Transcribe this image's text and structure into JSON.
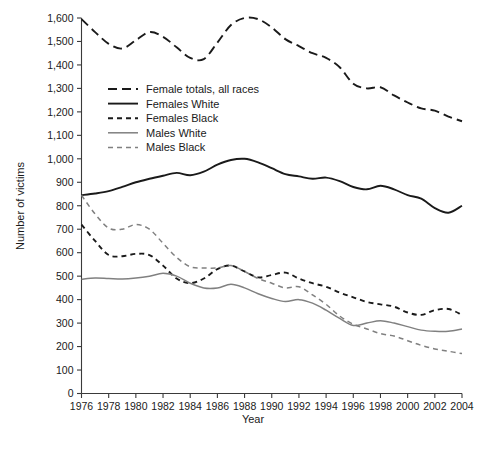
{
  "chart_data": {
    "type": "line",
    "title": "",
    "xlabel": "Year",
    "ylabel": "Number of victims",
    "xlim": [
      1976,
      2004
    ],
    "ylim": [
      0,
      1600
    ],
    "grid": false,
    "legend_position": "upper-left-inside",
    "x": [
      1976,
      1977,
      1978,
      1979,
      1980,
      1981,
      1982,
      1983,
      1984,
      1985,
      1986,
      1987,
      1988,
      1989,
      1990,
      1991,
      1992,
      1993,
      1994,
      1995,
      1996,
      1997,
      1998,
      1999,
      2000,
      2001,
      2002,
      2003,
      2004
    ],
    "x_ticks": [
      1976,
      1978,
      1980,
      1982,
      1984,
      1986,
      1988,
      1990,
      1992,
      1994,
      1996,
      1998,
      2000,
      2002,
      2004
    ],
    "x_tick_labels": [
      "1976",
      "1978",
      "1980",
      "1982",
      "1984",
      "1986",
      "1988",
      "1990",
      "1992",
      "1994",
      "1996",
      "1998",
      "2000",
      "2002",
      "2004"
    ],
    "y_ticks": [
      0,
      100,
      200,
      300,
      400,
      500,
      600,
      700,
      800,
      900,
      1000,
      1100,
      1200,
      1300,
      1400,
      1500,
      1600
    ],
    "y_tick_labels": [
      "0",
      "100",
      "200",
      "300",
      "400",
      "500",
      "600",
      "700",
      "800",
      "900",
      "1,000",
      "1,100",
      "1,200",
      "1,300",
      "1,400",
      "1,500",
      "1,600"
    ],
    "series": [
      {
        "name": "Female totals, all races",
        "color": "#1a1a1a",
        "width": 1.9,
        "dash": "9,5",
        "values": [
          1595,
          1540,
          1490,
          1470,
          1505,
          1540,
          1520,
          1475,
          1430,
          1425,
          1495,
          1570,
          1600,
          1595,
          1560,
          1510,
          1480,
          1450,
          1430,
          1390,
          1320,
          1300,
          1305,
          1270,
          1240,
          1215,
          1205,
          1180,
          1160
        ]
      },
      {
        "name": "Females White",
        "color": "#1a1a1a",
        "width": 1.9,
        "dash": "none",
        "values": [
          845,
          852,
          862,
          880,
          900,
          915,
          928,
          940,
          930,
          945,
          975,
          995,
          1000,
          985,
          960,
          935,
          925,
          915,
          920,
          905,
          880,
          870,
          885,
          870,
          845,
          830,
          790,
          770,
          800
        ]
      },
      {
        "name": "Females Black",
        "color": "#1a1a1a",
        "width": 1.9,
        "dash": "5,4",
        "values": [
          720,
          650,
          590,
          585,
          595,
          590,
          545,
          490,
          470,
          490,
          530,
          545,
          520,
          495,
          505,
          515,
          490,
          470,
          455,
          430,
          410,
          390,
          380,
          370,
          345,
          335,
          355,
          360,
          335
        ]
      },
      {
        "name": "Males White",
        "color": "#808080",
        "width": 1.5,
        "dash": "none",
        "values": [
          487,
          492,
          490,
          488,
          492,
          500,
          512,
          500,
          470,
          450,
          450,
          465,
          450,
          425,
          405,
          392,
          400,
          385,
          355,
          320,
          290,
          300,
          310,
          300,
          285,
          270,
          265,
          265,
          275
        ]
      },
      {
        "name": "Males Black",
        "color": "#808080",
        "width": 1.5,
        "dash": "5,4",
        "values": [
          845,
          765,
          705,
          700,
          720,
          700,
          640,
          580,
          540,
          535,
          535,
          545,
          520,
          490,
          470,
          450,
          455,
          420,
          380,
          330,
          295,
          275,
          255,
          245,
          225,
          205,
          190,
          180,
          170
        ]
      }
    ]
  },
  "legend": {
    "items": [
      {
        "label": "Female totals, all races"
      },
      {
        "label": "Females White"
      },
      {
        "label": "Females Black"
      },
      {
        "label": "Males White"
      },
      {
        "label": "Males Black"
      }
    ]
  },
  "axes": {
    "x_title": "Year",
    "y_title": "Number of victims"
  }
}
